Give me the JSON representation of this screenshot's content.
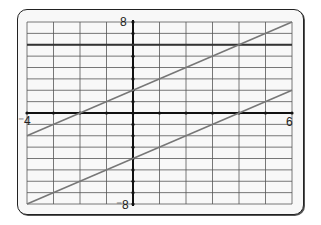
{
  "chart_data": {
    "type": "line",
    "title": "",
    "xlabel": "",
    "ylabel": "",
    "xlim": [
      -4,
      6
    ],
    "ylim": [
      -8,
      8
    ],
    "grid": true,
    "grid_step": {
      "x": 1,
      "y": 1
    },
    "tick_labels": {
      "xmin": "-4",
      "xmax": "6",
      "ymin": "-8",
      "ymax": "8"
    },
    "series": [
      {
        "name": "y = 6",
        "x": [
          -4,
          6
        ],
        "y": [
          6,
          6
        ],
        "color": "#333333"
      },
      {
        "name": "y = x + 2",
        "x": [
          -4,
          6
        ],
        "y": [
          -2,
          8
        ],
        "color": "#777777"
      },
      {
        "name": "y = x - 4",
        "x": [
          -4,
          6
        ],
        "y": [
          -8,
          2
        ],
        "color": "#777777"
      }
    ]
  },
  "labels": {
    "xmin": "⁻4",
    "xmax": "6",
    "ymax": "8",
    "ymin": "⁻8"
  }
}
